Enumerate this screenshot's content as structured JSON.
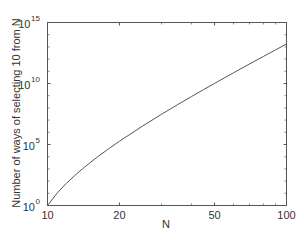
{
  "chart_data": {
    "type": "line",
    "title": "",
    "xlabel": "N",
    "ylabel": "Number of ways of selecting 10 from N",
    "xscale": "log",
    "yscale": "log",
    "xlim": [
      10,
      100
    ],
    "ylim": [
      1,
      1000000000000000.0
    ],
    "grid": false,
    "legend": null,
    "xticks": [
      {
        "value": 10,
        "label": "10"
      },
      {
        "value": 20,
        "label": "20"
      },
      {
        "value": 50,
        "label": "50"
      },
      {
        "value": 100,
        "label": "100"
      }
    ],
    "yticks": [
      {
        "exp": 0,
        "base": "10",
        "sup": "0"
      },
      {
        "exp": 5,
        "base": "10",
        "sup": "5"
      },
      {
        "exp": 10,
        "base": "10",
        "sup": "10"
      },
      {
        "exp": 15,
        "base": "10",
        "sup": "15"
      }
    ],
    "series": [
      {
        "name": "C(N,10)",
        "color": "#555555",
        "x": [
          10,
          11,
          12,
          13,
          14,
          15,
          16,
          18,
          20,
          25,
          30,
          35,
          40,
          45,
          50,
          60,
          70,
          80,
          90,
          100
        ],
        "log10_y": [
          0,
          1.041,
          1.82,
          2.456,
          3.0,
          3.477,
          3.905,
          4.644,
          5.267,
          6.513,
          7.477,
          8.263,
          8.928,
          9.503,
          10.01,
          10.877,
          11.598,
          12.215,
          12.756,
          13.238
        ]
      }
    ]
  },
  "colors": {
    "axis": "#555555",
    "line": "#555555",
    "background": "#ffffff"
  }
}
